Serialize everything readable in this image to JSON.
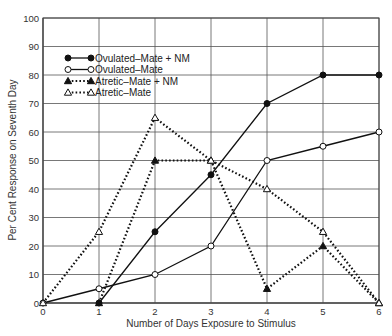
{
  "chart_data": {
    "type": "line",
    "title": "",
    "xlabel": "Number of Days Exposure to Stimulus",
    "ylabel": "Per Cent Response on Seventh Day",
    "x": [
      0,
      1,
      2,
      3,
      4,
      5,
      6
    ],
    "xlim": [
      0,
      6
    ],
    "ylim": [
      0,
      100
    ],
    "xticks": [
      "0",
      "1",
      "2",
      "3",
      "4",
      "5",
      "6"
    ],
    "yticks": [
      "0",
      "10",
      "20",
      "30",
      "40",
      "50",
      "60",
      "70",
      "80",
      "90",
      "100"
    ],
    "grid": true,
    "legend_position": "upper-left",
    "series": [
      {
        "name": "Ovulated–Mate + NM",
        "marker": "filled-circle",
        "line": "solid",
        "points": [
          [
            1,
            0
          ],
          [
            2,
            25
          ],
          [
            3,
            45
          ],
          [
            4,
            70
          ],
          [
            5,
            80
          ],
          [
            6,
            80
          ]
        ]
      },
      {
        "name": "Ovulated–Mate",
        "marker": "open-circle",
        "line": "solid",
        "points": [
          [
            0,
            0
          ],
          [
            1,
            5
          ],
          [
            2,
            10
          ],
          [
            3,
            20
          ],
          [
            4,
            50
          ],
          [
            5,
            55
          ],
          [
            6,
            60
          ]
        ]
      },
      {
        "name": "Atretic–Mate + NM",
        "marker": "filled-triangle",
        "line": "dotted",
        "points": [
          [
            1,
            0
          ],
          [
            2,
            50
          ],
          [
            3,
            50
          ],
          [
            4,
            5
          ],
          [
            5,
            20
          ],
          [
            6,
            0
          ]
        ]
      },
      {
        "name": "Atretic–Mate",
        "marker": "open-triangle",
        "line": "dotted",
        "points": [
          [
            0,
            0
          ],
          [
            1,
            25
          ],
          [
            2,
            65
          ],
          [
            3,
            50
          ],
          [
            4,
            40
          ],
          [
            5,
            25
          ],
          [
            6,
            0
          ]
        ]
      }
    ]
  }
}
